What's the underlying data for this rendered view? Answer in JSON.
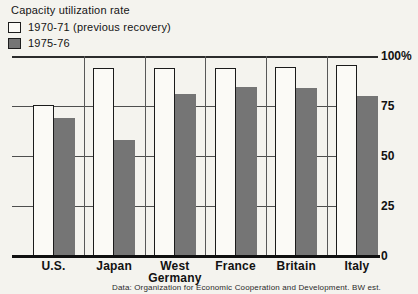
{
  "page": {
    "background": "#f4f3ee"
  },
  "header": {
    "title": "Capacity utilization rate"
  },
  "legend": {
    "items": [
      {
        "label": "1970-71 (previous recovery)"
      },
      {
        "label": "1975-76"
      }
    ]
  },
  "footer": {
    "source": "Data: Organization for Economic Cooperation and Development. BW est."
  },
  "chart_data": {
    "type": "bar",
    "title": "Capacity utilization rate",
    "categories": [
      "U.S.",
      "Japan",
      "West Germany",
      "France",
      "Britain",
      "Italy"
    ],
    "series": [
      {
        "name": "1970-71 (previous recovery)",
        "color": "#fbfaf6",
        "outline": "#1b1b1b",
        "values": [
          75.5,
          94,
          94,
          94,
          94.5,
          95.5
        ]
      },
      {
        "name": "1975-76",
        "color": "#757575",
        "values": [
          69,
          58,
          81,
          84.5,
          84,
          80
        ]
      }
    ],
    "xlabel": "",
    "ylabel": "",
    "y_axis": {
      "side": "right",
      "range": [
        0,
        100
      ],
      "ticks": [
        {
          "value": 100,
          "label": "100%"
        },
        {
          "value": 75,
          "label": "75"
        },
        {
          "value": 50,
          "label": "50"
        },
        {
          "value": 25,
          "label": "25"
        },
        {
          "value": 0,
          "label": "0"
        }
      ]
    },
    "grid": true,
    "legend_position": "top-left"
  }
}
